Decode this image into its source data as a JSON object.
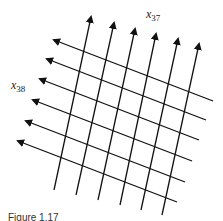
{
  "figure": {
    "labels": {
      "x37": {
        "base": "x",
        "sub": "37"
      },
      "x38": {
        "base": "x",
        "sub": "38"
      }
    },
    "caption": "Figure 1.17",
    "line_color": "#111111",
    "families": [
      {
        "name": "x37",
        "direction": "up-right steep",
        "count": 6
      },
      {
        "name": "x38",
        "direction": "up-left shallow",
        "count": 6
      }
    ]
  }
}
